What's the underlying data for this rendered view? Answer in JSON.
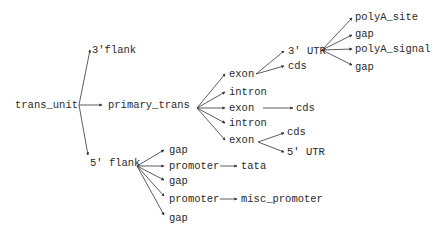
{
  "diagram": {
    "type": "tree",
    "colors": {
      "line": "#333333",
      "text": "#2a2a2a",
      "background": "#ffffff"
    },
    "nodes": [
      {
        "id": "trans_unit",
        "label": "trans_unit",
        "x": 15,
        "y": 108,
        "ax": 77,
        "ay": 105
      },
      {
        "id": "flank3",
        "label": "3'flank",
        "x": 92,
        "y": 53,
        "ax": 90,
        "ay": 50
      },
      {
        "id": "primary_trans",
        "label": "primary_trans",
        "x": 108,
        "y": 108,
        "ax": 102,
        "ay": 105
      },
      {
        "id": "flank5",
        "label": "5' flank",
        "x": 90,
        "y": 166,
        "ax": 88,
        "ay": 155
      },
      {
        "id": "exon1",
        "label": "exon",
        "x": 229,
        "y": 77,
        "ax": 225,
        "ay": 74
      },
      {
        "id": "intron1",
        "label": "intron",
        "x": 229,
        "y": 95,
        "ax": 225,
        "ay": 92
      },
      {
        "id": "exon2",
        "label": "exon",
        "x": 229,
        "y": 111,
        "ax": 225,
        "ay": 108
      },
      {
        "id": "intron2",
        "label": "intron",
        "x": 229,
        "y": 126,
        "ax": 225,
        "ay": 123
      },
      {
        "id": "exon3",
        "label": "exon",
        "x": 229,
        "y": 143,
        "ax": 225,
        "ay": 140
      },
      {
        "id": "utr3",
        "label": "3' UTR",
        "x": 288,
        "y": 54,
        "ax": 284,
        "ay": 51
      },
      {
        "id": "cds1",
        "label": "cds",
        "x": 288,
        "y": 69,
        "ax": 284,
        "ay": 66
      },
      {
        "id": "polyA_site",
        "label": "polyA_site",
        "x": 355,
        "y": 20,
        "ax": 352,
        "ay": 18
      },
      {
        "id": "gap_a",
        "label": "gap",
        "x": 355,
        "y": 37,
        "ax": 352,
        "ay": 35
      },
      {
        "id": "polyA_signal",
        "label": "polyA_signal",
        "x": 355,
        "y": 52,
        "ax": 352,
        "ay": 49
      },
      {
        "id": "gap_b",
        "label": "gap",
        "x": 355,
        "y": 70,
        "ax": 352,
        "ay": 65
      },
      {
        "id": "cds2",
        "label": "cds",
        "x": 296,
        "y": 111,
        "ax": 293,
        "ay": 108
      },
      {
        "id": "cds3",
        "label": "cds",
        "x": 287,
        "y": 135,
        "ax": 284,
        "ay": 133
      },
      {
        "id": "utr5",
        "label": "5' UTR",
        "x": 287,
        "y": 155,
        "ax": 284,
        "ay": 152
      },
      {
        "id": "gap1",
        "label": "gap",
        "x": 169,
        "y": 153,
        "ax": 164,
        "ay": 150
      },
      {
        "id": "promoter1",
        "label": "promoter",
        "x": 169,
        "y": 169,
        "ax": 164,
        "ay": 166
      },
      {
        "id": "gap2",
        "label": "gap",
        "x": 169,
        "y": 184,
        "ax": 164,
        "ay": 180
      },
      {
        "id": "promoter2",
        "label": "promoter",
        "x": 169,
        "y": 202,
        "ax": 164,
        "ay": 196
      },
      {
        "id": "gap3",
        "label": "gap",
        "x": 169,
        "y": 221,
        "ax": 164,
        "ay": 215
      },
      {
        "id": "tata",
        "label": "tata",
        "x": 241,
        "y": 169,
        "ax": 237,
        "ay": 166
      },
      {
        "id": "misc_promoter",
        "label": "misc_promoter",
        "x": 241,
        "y": 202,
        "ax": 237,
        "ay": 199
      }
    ],
    "edges": [
      {
        "from": "trans_unit",
        "to": "flank3",
        "sx": 79,
        "sy": 105
      },
      {
        "from": "trans_unit",
        "to": "primary_trans",
        "sx": 79,
        "sy": 105
      },
      {
        "from": "trans_unit",
        "to": "flank5",
        "sx": 79,
        "sy": 105
      },
      {
        "from": "primary_trans",
        "to": "exon1",
        "sx": 197,
        "sy": 108
      },
      {
        "from": "primary_trans",
        "to": "intron1",
        "sx": 197,
        "sy": 108
      },
      {
        "from": "primary_trans",
        "to": "exon2",
        "sx": 197,
        "sy": 108
      },
      {
        "from": "primary_trans",
        "to": "intron2",
        "sx": 197,
        "sy": 108
      },
      {
        "from": "primary_trans",
        "to": "exon3",
        "sx": 197,
        "sy": 108
      },
      {
        "from": "exon1",
        "to": "utr3",
        "sx": 256,
        "sy": 74
      },
      {
        "from": "exon1",
        "to": "cds1",
        "sx": 256,
        "sy": 74
      },
      {
        "from": "utr3",
        "to": "polyA_site",
        "sx": 322,
        "sy": 50
      },
      {
        "from": "utr3",
        "to": "gap_a",
        "sx": 322,
        "sy": 50
      },
      {
        "from": "utr3",
        "to": "polyA_signal",
        "sx": 322,
        "sy": 50
      },
      {
        "from": "utr3",
        "to": "gap_b",
        "sx": 322,
        "sy": 50
      },
      {
        "from": "exon2",
        "to": "cds2",
        "sx": 263,
        "sy": 108
      },
      {
        "from": "exon3",
        "to": "cds3",
        "sx": 258,
        "sy": 142
      },
      {
        "from": "exon3",
        "to": "utr5",
        "sx": 258,
        "sy": 142
      },
      {
        "from": "flank5",
        "to": "gap1",
        "sx": 137,
        "sy": 166
      },
      {
        "from": "flank5",
        "to": "promoter1",
        "sx": 137,
        "sy": 166
      },
      {
        "from": "flank5",
        "to": "gap2",
        "sx": 137,
        "sy": 166
      },
      {
        "from": "flank5",
        "to": "promoter2",
        "sx": 137,
        "sy": 166
      },
      {
        "from": "flank5",
        "to": "gap3",
        "sx": 137,
        "sy": 166
      },
      {
        "from": "promoter1",
        "to": "tata",
        "sx": 220,
        "sy": 166
      },
      {
        "from": "promoter2",
        "to": "misc_promoter",
        "sx": 220,
        "sy": 199
      }
    ]
  }
}
